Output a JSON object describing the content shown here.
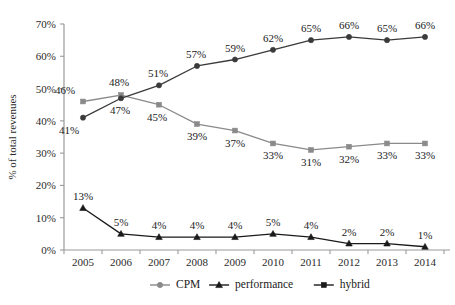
{
  "chart_data": {
    "type": "line",
    "title": "",
    "xlabel": "",
    "ylabel": "% of total revenues",
    "categories": [
      "2005",
      "2006",
      "2007",
      "2008",
      "2009",
      "2010",
      "2011",
      "2012",
      "2013",
      "2014"
    ],
    "ylim": [
      0,
      70
    ],
    "ytick_labels": [
      "0%",
      "10%",
      "20%",
      "30%",
      "40%",
      "50%",
      "60%",
      "70%"
    ],
    "ytick_values": [
      0,
      10,
      20,
      30,
      40,
      50,
      60,
      70
    ],
    "grid": false,
    "legend_position": "bottom",
    "series": [
      {
        "name": "CPM",
        "marker": "square",
        "color": "#8a8a8a",
        "label_position": "below",
        "values": [
          46,
          48,
          45,
          39,
          37,
          33,
          31,
          32,
          33,
          33
        ],
        "data_labels": [
          "46%",
          "48%",
          "45%",
          "39%",
          "37%",
          "33%",
          "31%",
          "32%",
          "33%",
          "33%"
        ]
      },
      {
        "name": "performance",
        "marker": "triangle",
        "color": "#1a1a1a",
        "label_position": "above",
        "values": [
          13,
          5,
          4,
          4,
          4,
          5,
          4,
          2,
          2,
          1
        ],
        "data_labels": [
          "13%",
          "5%",
          "4%",
          "4%",
          "4%",
          "5%",
          "4%",
          "2%",
          "2%",
          "1%"
        ]
      },
      {
        "name": "hybrid",
        "marker": "circle",
        "color": "#3a3a3a",
        "label_position": "above",
        "values": [
          41,
          47,
          51,
          57,
          59,
          62,
          65,
          66,
          65,
          66
        ],
        "data_labels": [
          "41%",
          "47%",
          "51%",
          "57%",
          "59%",
          "62%",
          "65%",
          "66%",
          "65%",
          "66%"
        ]
      }
    ],
    "label_overrides": {
      "CPM": [
        {
          "index": 0,
          "dx": -18,
          "dy": -7
        },
        {
          "index": 1,
          "dx": -2,
          "dy": -9
        },
        {
          "index": 2,
          "dx": -2,
          "dy": 16
        },
        {
          "index": 3,
          "dx": 0,
          "dy": 16
        },
        {
          "index": 4,
          "dx": 0,
          "dy": 16
        },
        {
          "index": 5,
          "dx": 0,
          "dy": 16
        },
        {
          "index": 6,
          "dx": 0,
          "dy": 16
        },
        {
          "index": 7,
          "dx": 0,
          "dy": 16
        },
        {
          "index": 8,
          "dx": 0,
          "dy": 16
        },
        {
          "index": 9,
          "dx": 0,
          "dy": 16
        }
      ],
      "hybrid": [
        {
          "index": 0,
          "dx": -14,
          "dy": 16
        },
        {
          "index": 1,
          "dx": -1,
          "dy": 16
        },
        {
          "index": 2,
          "dx": -1,
          "dy": -8
        },
        {
          "index": 3,
          "dx": -1,
          "dy": -8
        },
        {
          "index": 4,
          "dx": 0,
          "dy": -8
        },
        {
          "index": 5,
          "dx": 0,
          "dy": -8
        },
        {
          "index": 6,
          "dx": 0,
          "dy": -8
        },
        {
          "index": 7,
          "dx": 0,
          "dy": -8
        },
        {
          "index": 8,
          "dx": 0,
          "dy": -8
        },
        {
          "index": 9,
          "dx": 0,
          "dy": -8
        }
      ],
      "performance": [
        {
          "index": 0,
          "dx": 0,
          "dy": -8
        },
        {
          "index": 1,
          "dx": 0,
          "dy": -8
        },
        {
          "index": 2,
          "dx": 0,
          "dy": -8
        },
        {
          "index": 3,
          "dx": 0,
          "dy": -8
        },
        {
          "index": 4,
          "dx": 0,
          "dy": -8
        },
        {
          "index": 5,
          "dx": 0,
          "dy": -8
        },
        {
          "index": 6,
          "dx": 0,
          "dy": -8
        },
        {
          "index": 7,
          "dx": 0,
          "dy": -8
        },
        {
          "index": 8,
          "dx": 0,
          "dy": -8
        },
        {
          "index": 9,
          "dx": 0,
          "dy": -8
        }
      ]
    }
  },
  "legend": {
    "items": [
      {
        "label": "CPM",
        "marker": "circle",
        "color": "#8a8a8a"
      },
      {
        "label": "performance",
        "marker": "triangle",
        "color": "#1a1a1a"
      },
      {
        "label": "hybrid",
        "marker": "square",
        "color": "#1a1a1a"
      }
    ]
  },
  "axes": {
    "y_axis_color": "#9a9a9a",
    "x_axis_color": "#9a9a9a"
  },
  "geometry": {
    "plot_left": 64,
    "plot_right": 444,
    "plot_top": 24,
    "plot_bottom": 250,
    "legend_y": 285,
    "xtick_label_y": 266
  }
}
